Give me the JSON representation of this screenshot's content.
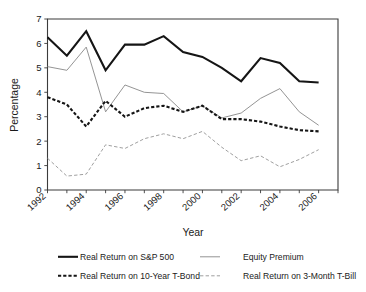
{
  "chart_data": {
    "type": "line",
    "title": "",
    "xlabel": "Year",
    "ylabel": "Percentage",
    "xlim": [
      1992,
      2007
    ],
    "ylim": [
      0,
      7
    ],
    "grid": false,
    "legend_position": "bottom",
    "x": [
      1992,
      1993,
      1994,
      1995,
      1996,
      1997,
      1998,
      1999,
      2000,
      2001,
      2002,
      2003,
      2004,
      2005,
      2006
    ],
    "xtick_labels": [
      "1992",
      "1994",
      "1996",
      "1998",
      "2000",
      "2002",
      "2004",
      "2006"
    ],
    "xtick_values": [
      1992,
      1994,
      1996,
      1998,
      2000,
      2002,
      2004,
      2006
    ],
    "ytick_labels": [
      "0",
      "1",
      "2",
      "3",
      "4",
      "5",
      "6",
      "7"
    ],
    "ytick_values": [
      0,
      1,
      2,
      3,
      4,
      5,
      6,
      7
    ],
    "series": [
      {
        "name": "Real Return on S&P 500",
        "style": "thick-solid",
        "color": "#151515",
        "values": [
          6.25,
          5.5,
          6.5,
          4.9,
          5.95,
          5.95,
          6.3,
          5.65,
          5.45,
          5.0,
          4.45,
          5.4,
          5.2,
          4.45,
          4.4
        ]
      },
      {
        "name": "Equity Premium",
        "style": "thin-solid",
        "color": "#8e8e8e",
        "values": [
          5.05,
          4.9,
          5.85,
          3.2,
          4.3,
          4.0,
          3.95,
          3.2,
          3.45,
          2.95,
          3.15,
          3.75,
          4.15,
          3.2,
          2.65
        ]
      },
      {
        "name": "Real Return on 10-Year T-Bond",
        "style": "thick-dashed",
        "color": "#151515",
        "values": [
          3.8,
          3.5,
          2.6,
          3.65,
          3.0,
          3.35,
          3.45,
          3.2,
          3.45,
          2.9,
          2.9,
          2.8,
          2.6,
          2.45,
          2.4
        ]
      },
      {
        "name": "Real Return on 3-Month T-Bill",
        "style": "thin-dashed",
        "color": "#9a9a9a",
        "values": [
          1.3,
          0.57,
          0.65,
          1.85,
          1.7,
          2.1,
          2.3,
          2.1,
          2.4,
          1.75,
          1.2,
          1.4,
          0.95,
          1.25,
          1.65
        ]
      }
    ]
  },
  "axes": {
    "y_title": "Percentage",
    "x_title": "Year"
  },
  "legend": {
    "items": [
      {
        "label": "Real Return on S&P 500",
        "style": "thick-solid",
        "color": "#151515"
      },
      {
        "label": "Equity Premium",
        "style": "thin-solid",
        "color": "#8e8e8e"
      },
      {
        "label": "Real Return on 10-Year T-Bond",
        "style": "thick-dashed",
        "color": "#151515"
      },
      {
        "label": "Real Return on 3-Month T-Bill",
        "style": "thin-dashed",
        "color": "#9a9a9a"
      }
    ]
  }
}
